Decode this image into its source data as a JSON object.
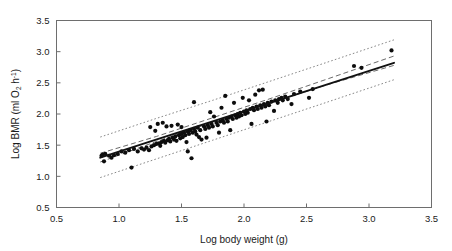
{
  "chart_data": {
    "type": "scatter",
    "title": "",
    "xlabel": "Log body weight (g)",
    "ylabel_parts": {
      "main": "Log BMR (ml O",
      "sub": "2",
      "mid": " h",
      "sup": "-1",
      "close": ")"
    },
    "ylabel_plain": "Log BMR (ml O2 h-1)",
    "xlim": [
      0.5,
      3.5
    ],
    "ylim": [
      0.5,
      3.5
    ],
    "xticks": [
      0.5,
      1.0,
      1.5,
      2.0,
      2.5,
      3.0,
      3.5
    ],
    "xtick_labels": [
      "0.5",
      "1.0",
      "1.5",
      "2.0",
      "2.5",
      "3.0",
      "3.5"
    ],
    "yticks": [
      0.5,
      1.0,
      1.5,
      2.0,
      2.5,
      3.0,
      3.5
    ],
    "ytick_labels": [
      "0.5",
      "1.0",
      "1.5",
      "2.0",
      "2.5",
      "3.0",
      "3.5"
    ],
    "grid": false,
    "legend": null,
    "marker": {
      "shape": "circle",
      "size": 2.1,
      "color": "#0d0d0d"
    },
    "fit": {
      "name": "regression-line",
      "style": "solid",
      "color": "#111111",
      "x": [
        0.85,
        3.2
      ],
      "y": [
        1.3,
        2.82
      ],
      "slope": 0.647,
      "intercept": 0.75
    },
    "confidence_band": {
      "name": "confidence-interval",
      "style": "dashed",
      "color": "#5a5a5a",
      "x": [
        0.85,
        1.3,
        1.75,
        2.2,
        2.65,
        3.2
      ],
      "upper": [
        1.37,
        1.64,
        1.94,
        2.24,
        2.55,
        2.93
      ],
      "lower": [
        1.23,
        1.56,
        1.87,
        2.17,
        2.46,
        2.78
      ]
    },
    "prediction_band": {
      "name": "prediction-interval",
      "style": "dotted",
      "color": "#7a7a7a",
      "x": [
        0.85,
        1.3,
        1.75,
        2.2,
        2.65,
        3.2
      ],
      "upper": [
        1.63,
        1.93,
        2.22,
        2.52,
        2.82,
        3.19
      ],
      "lower": [
        0.98,
        1.28,
        1.58,
        1.88,
        2.18,
        2.55
      ]
    },
    "points": [
      [
        0.86,
        1.33
      ],
      [
        0.87,
        1.35
      ],
      [
        0.88,
        1.24
      ],
      [
        0.89,
        1.36
      ],
      [
        0.92,
        1.33
      ],
      [
        0.94,
        1.3
      ],
      [
        0.96,
        1.34
      ],
      [
        0.99,
        1.36
      ],
      [
        1.02,
        1.4
      ],
      [
        1.05,
        1.38
      ],
      [
        1.08,
        1.42
      ],
      [
        1.1,
        1.14
      ],
      [
        1.12,
        1.44
      ],
      [
        1.15,
        1.4
      ],
      [
        1.18,
        1.45
      ],
      [
        1.2,
        1.43
      ],
      [
        1.22,
        1.46
      ],
      [
        1.24,
        1.42
      ],
      [
        1.25,
        1.79
      ],
      [
        1.26,
        1.48
      ],
      [
        1.28,
        1.5
      ],
      [
        1.29,
        1.73
      ],
      [
        1.3,
        1.52
      ],
      [
        1.31,
        1.84
      ],
      [
        1.32,
        1.53
      ],
      [
        1.33,
        1.49
      ],
      [
        1.34,
        1.55
      ],
      [
        1.35,
        1.86
      ],
      [
        1.36,
        1.57
      ],
      [
        1.37,
        1.54
      ],
      [
        1.38,
        1.8
      ],
      [
        1.39,
        1.58
      ],
      [
        1.4,
        1.6
      ],
      [
        1.41,
        1.56
      ],
      [
        1.42,
        1.81
      ],
      [
        1.43,
        1.62
      ],
      [
        1.44,
        1.59
      ],
      [
        1.45,
        1.64
      ],
      [
        1.46,
        1.57
      ],
      [
        1.47,
        1.83
      ],
      [
        1.48,
        1.66
      ],
      [
        1.49,
        1.61
      ],
      [
        1.5,
        1.68
      ],
      [
        1.5,
        1.79
      ],
      [
        1.51,
        1.63
      ],
      [
        1.52,
        1.7
      ],
      [
        1.53,
        1.66
      ],
      [
        1.54,
        1.55
      ],
      [
        1.55,
        1.72
      ],
      [
        1.55,
        1.4
      ],
      [
        1.56,
        1.68
      ],
      [
        1.57,
        1.74
      ],
      [
        1.58,
        1.29
      ],
      [
        1.59,
        1.7
      ],
      [
        1.6,
        2.19
      ],
      [
        1.6,
        1.76
      ],
      [
        1.61,
        1.72
      ],
      [
        1.62,
        1.67
      ],
      [
        1.63,
        1.78
      ],
      [
        1.64,
        1.63
      ],
      [
        1.65,
        1.74
      ],
      [
        1.66,
        1.59
      ],
      [
        1.68,
        1.8
      ],
      [
        1.69,
        1.76
      ],
      [
        1.7,
        1.62
      ],
      [
        1.71,
        1.82
      ],
      [
        1.72,
        1.78
      ],
      [
        1.73,
        2.03
      ],
      [
        1.74,
        1.84
      ],
      [
        1.75,
        1.8
      ],
      [
        1.76,
        1.96
      ],
      [
        1.78,
        1.86
      ],
      [
        1.79,
        1.82
      ],
      [
        1.8,
        1.7
      ],
      [
        1.81,
        1.88
      ],
      [
        1.82,
        2.1
      ],
      [
        1.83,
        1.9
      ],
      [
        1.84,
        1.86
      ],
      [
        1.85,
        2.29
      ],
      [
        1.86,
        1.92
      ],
      [
        1.87,
        1.88
      ],
      [
        1.88,
        1.94
      ],
      [
        1.89,
        1.74
      ],
      [
        1.9,
        1.96
      ],
      [
        1.91,
        1.92
      ],
      [
        1.92,
        2.18
      ],
      [
        1.93,
        1.98
      ],
      [
        1.94,
        1.94
      ],
      [
        1.95,
        2.0
      ],
      [
        1.96,
        1.96
      ],
      [
        1.97,
        2.02
      ],
      [
        1.98,
        1.98
      ],
      [
        1.99,
        2.26
      ],
      [
        2.0,
        2.04
      ],
      [
        2.01,
        2.0
      ],
      [
        2.02,
        2.06
      ],
      [
        2.03,
        2.02
      ],
      [
        2.04,
        2.22
      ],
      [
        2.05,
        2.08
      ],
      [
        2.06,
        1.84
      ],
      [
        2.07,
        2.1
      ],
      [
        2.08,
        2.06
      ],
      [
        2.09,
        2.31
      ],
      [
        2.1,
        2.12
      ],
      [
        2.11,
        2.08
      ],
      [
        2.12,
        2.38
      ],
      [
        2.13,
        2.14
      ],
      [
        2.14,
        2.1
      ],
      [
        2.15,
        2.39
      ],
      [
        2.16,
        2.16
      ],
      [
        2.17,
        2.12
      ],
      [
        2.18,
        1.88
      ],
      [
        2.19,
        2.18
      ],
      [
        2.2,
        2.14
      ],
      [
        2.22,
        2.2
      ],
      [
        2.24,
        2.05
      ],
      [
        2.25,
        2.22
      ],
      [
        2.27,
        2.18
      ],
      [
        2.28,
        2.24
      ],
      [
        2.3,
        2.26
      ],
      [
        2.31,
        2.22
      ],
      [
        2.33,
        2.28
      ],
      [
        2.35,
        2.24
      ],
      [
        2.38,
        2.16
      ],
      [
        2.4,
        2.32
      ],
      [
        2.45,
        2.36
      ],
      [
        2.52,
        2.26
      ],
      [
        2.55,
        2.4
      ],
      [
        2.88,
        2.77
      ],
      [
        2.94,
        2.74
      ],
      [
        3.18,
        3.02
      ]
    ]
  }
}
